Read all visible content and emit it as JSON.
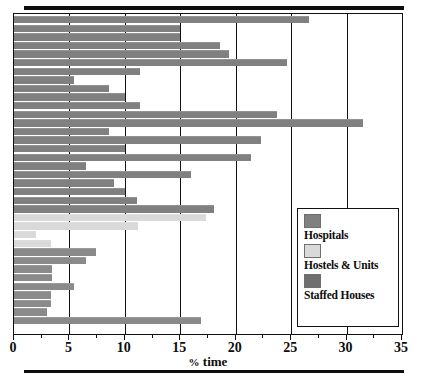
{
  "chart_data": {
    "type": "bar",
    "orientation": "horizontal",
    "title": "",
    "xlabel": "% time",
    "ylabel": "",
    "xlim": [
      0,
      35
    ],
    "xticks": [
      0,
      5,
      10,
      15,
      20,
      25,
      30,
      35
    ],
    "xticklabels": [
      "0",
      "5",
      "10",
      "15",
      "20",
      "25",
      "30",
      "35"
    ],
    "yticklabels": [],
    "grid": "vertical",
    "legend_position": "lower-right",
    "series": [
      {
        "name": "Hospitals",
        "color": "#808080",
        "values": [
          26.6,
          15.0,
          15.0,
          18.6,
          19.4,
          24.6,
          11.4,
          5.4,
          8.6,
          10.0,
          11.4,
          23.7,
          31.5,
          8.6,
          22.3,
          10.0,
          21.4,
          6.5,
          16.0,
          9.0,
          10.0,
          11.1,
          18.0
        ]
      },
      {
        "name": "Hostels & Units",
        "color": "#d9d9d9",
        "values": [
          17.3,
          11.2,
          2.0,
          3.3
        ]
      },
      {
        "name": "Staffed Houses",
        "color": "#8a8a8a",
        "values": [
          7.4,
          6.5,
          3.4,
          3.4,
          5.4,
          3.3,
          3.3,
          3.0,
          16.9
        ]
      }
    ]
  },
  "legend": {
    "entries": [
      {
        "label": "Hospitals",
        "color": "#808080"
      },
      {
        "label": "Hostels & Units",
        "color": "#d9d9d9"
      },
      {
        "label": "Staffed Houses",
        "color": "#6e6e6e"
      }
    ]
  },
  "axis": {
    "unit_symbol": "%",
    "unit_word": "time"
  }
}
